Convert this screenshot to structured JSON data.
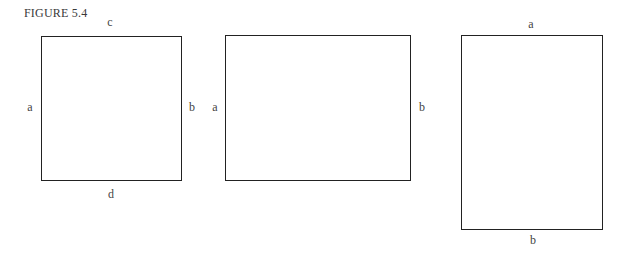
{
  "figure": {
    "title": "FIGURE 5.4"
  },
  "shapes": [
    {
      "name": "square",
      "labels": {
        "top": "c",
        "left": "a",
        "right": "b",
        "bottom": "d"
      }
    },
    {
      "name": "landscape-rectangle",
      "labels": {
        "left": "a",
        "right": "b"
      }
    },
    {
      "name": "portrait-rectangle",
      "labels": {
        "top": "a",
        "bottom": "b"
      }
    }
  ]
}
